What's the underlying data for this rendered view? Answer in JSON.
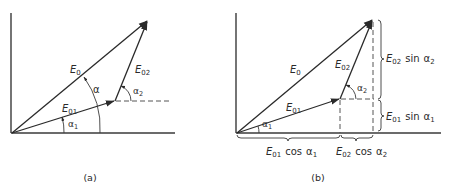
{
  "panels": [
    {
      "id": "a",
      "caption": "(a)",
      "vectors": {
        "E0": {
          "sym": "E",
          "sub": "0"
        },
        "E01": {
          "sym": "E",
          "sub": "01"
        },
        "E02": {
          "sym": "E",
          "sub": "02"
        }
      },
      "angles": {
        "alpha": {
          "sym": "α",
          "sub": ""
        },
        "alpha1": {
          "sym": "α",
          "sub": "1"
        },
        "alpha2": {
          "sym": "α",
          "sub": "2"
        }
      }
    },
    {
      "id": "b",
      "caption": "(b)",
      "vectors": {
        "E0": {
          "sym": "E",
          "sub": "0"
        },
        "E01": {
          "sym": "E",
          "sub": "01"
        },
        "E02": {
          "sym": "E",
          "sub": "02"
        }
      },
      "angles": {
        "alpha1": {
          "sym": "α",
          "sub": "1"
        },
        "alpha2": {
          "sym": "α",
          "sub": "2"
        }
      },
      "components": {
        "e02_sin": {
          "sym": "E",
          "sub": "02",
          "fn": "sin",
          "ang": "α",
          "angsub": "2"
        },
        "e01_sin": {
          "sym": "E",
          "sub": "01",
          "fn": "sin",
          "ang": "α",
          "angsub": "1"
        },
        "e01_cos": {
          "sym": "E",
          "sub": "01",
          "fn": "cos",
          "ang": "α",
          "angsub": "1"
        },
        "e02_cos": {
          "sym": "E",
          "sub": "02",
          "fn": "cos",
          "ang": "α",
          "angsub": "2"
        }
      }
    }
  ]
}
